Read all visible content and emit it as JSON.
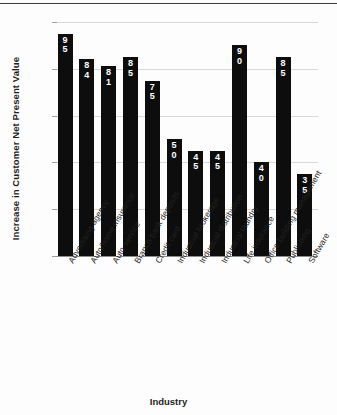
{
  "chart_data": {
    "type": "bar",
    "title": "",
    "xlabel": "Industry",
    "ylabel": "Increase in Customer Net Present Value",
    "ylim": [
      0,
      100
    ],
    "yticks": [
      "0",
      "20",
      "40",
      "60",
      "80",
      "100%"
    ],
    "ytick_values": [
      0,
      20,
      40,
      60,
      80,
      100
    ],
    "grid": true,
    "legend": "none",
    "value_label_position": "inside-top",
    "value_label_color": "#ffffff",
    "bar_color": "#0d0d0d",
    "categories": [
      "Advertising agency",
      "Auto/home insurance",
      "Auto service",
      "Branch bank deposits",
      "Credit card",
      "Industrial brokerage",
      "Industrial distribution",
      "Industrial laundry",
      "Life insurance",
      "Office building management",
      "Publishing",
      "Software"
    ],
    "values": [
      95,
      84,
      81,
      85,
      75,
      50,
      45,
      45,
      90,
      40,
      85,
      35
    ],
    "value_labels": [
      "95",
      "84",
      "81",
      "85",
      "75",
      "50",
      "45",
      "45",
      "90",
      "40",
      "85",
      "35"
    ]
  }
}
